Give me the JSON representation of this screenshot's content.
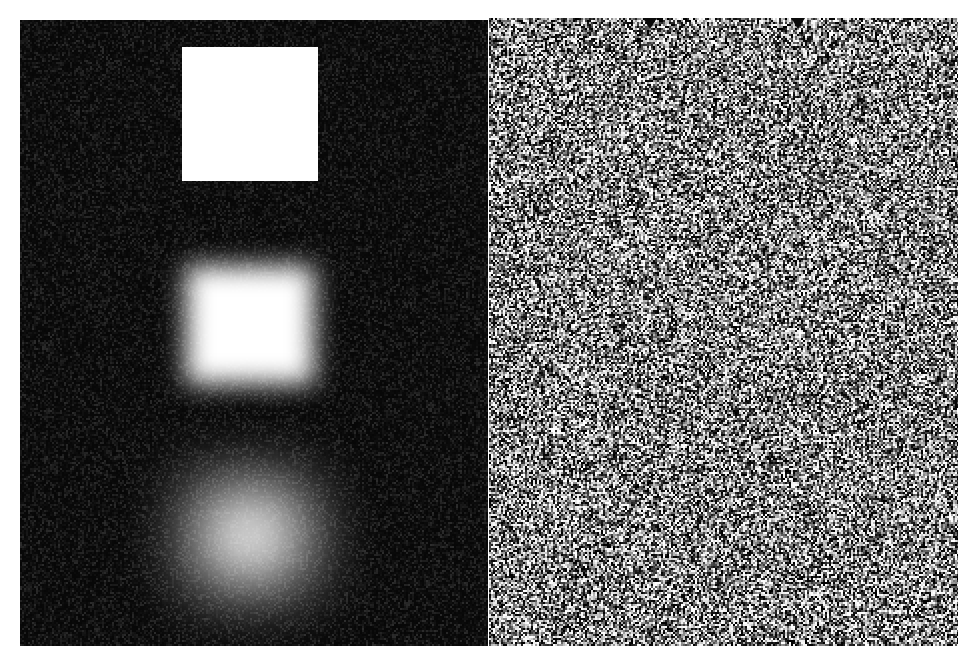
{
  "figure": {
    "width": 973,
    "height": 659,
    "background_color": "#ffffff"
  },
  "panels": [
    {
      "id": "left-panel",
      "name": "blur-sequence-panel",
      "label": "Blurred square sequence",
      "x": 20,
      "y": 20,
      "width": 468,
      "height": 626,
      "background_color": "#070707",
      "grain": {
        "type": "film-grain",
        "amplitude_label": "low",
        "cell_px": 2
      }
    },
    {
      "id": "right-panel",
      "name": "noise-field-panel",
      "label": "Random noise field",
      "x": 489,
      "y": 18,
      "width": 469,
      "height": 628,
      "background_color": "#b9b9b9",
      "grain": {
        "type": "salt-and-pepper",
        "amplitude_label": "high",
        "cell_px": 2
      }
    }
  ],
  "squares": [
    {
      "name": "square-sharp",
      "label": "No blur",
      "blur_sigma": 0,
      "blur_px": 0,
      "x": 182,
      "y": 47,
      "width": 136,
      "height": 134,
      "fill_color": "#ffffff"
    },
    {
      "name": "square-medium-blur",
      "label": "Medium blur",
      "blur_sigma": 6,
      "blur_px": 13,
      "x": 186,
      "y": 266,
      "width": 128,
      "height": 118,
      "fill_color": "#ffffff"
    },
    {
      "name": "square-heavy-blur",
      "label": "Heavy blur",
      "blur_sigma": 18,
      "blur_px": 34,
      "x": 196,
      "y": 488,
      "width": 108,
      "height": 96,
      "fill_color": "#ffffff"
    }
  ],
  "markers": [
    {
      "name": "marker-left",
      "label": "Marker 1",
      "shape": "triangle-down-icon",
      "x": 650,
      "y": 18,
      "size": 14,
      "color": "#0a0a0a"
    },
    {
      "name": "marker-right",
      "label": "Marker 2",
      "shape": "triangle-down-icon",
      "x": 798,
      "y": 18,
      "size": 14,
      "color": "#0a0a0a"
    }
  ]
}
